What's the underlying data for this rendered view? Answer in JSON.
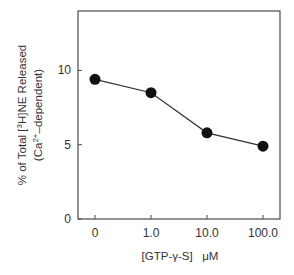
{
  "chart_data": {
    "type": "line",
    "title": "",
    "xlabel": "[GTP-γ-S]   μM",
    "ylabel": "% of Total [3H]NE Released",
    "ylabel_line2": "(Ca2+-dependent)",
    "categories": [
      "0",
      "1.0",
      "10.0",
      "100.0"
    ],
    "series": [
      {
        "name": "Ca2+-dependent [3H]NE release",
        "values": [
          9.4,
          8.5,
          5.8,
          4.9
        ],
        "marker": "filled-circle",
        "color": "#111111"
      }
    ],
    "ylim": [
      0,
      14
    ],
    "yticks": [
      0,
      5,
      10
    ],
    "ytick_labels": [
      "0",
      "5",
      "10"
    ],
    "grid": false,
    "legend": null
  },
  "plot": {
    "left": 78,
    "top": 11,
    "right": 280,
    "bottom": 219,
    "x_positions": [
      95,
      151,
      207,
      263
    ]
  }
}
